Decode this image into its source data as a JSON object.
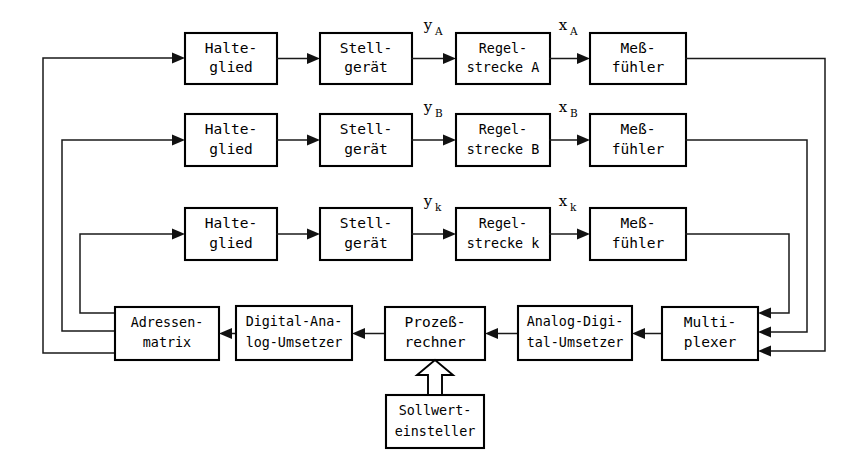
{
  "diagram": {
    "stroke_color": "#1a1a1a",
    "box_stroke_color": "#000000",
    "background_color": "#ffffff"
  },
  "rows": [
    {
      "id": "row-a",
      "halteglied": {
        "line1": "Halte-",
        "line2": "glied"
      },
      "stellgeraet": {
        "line1": "Stell-",
        "line2": "gerät"
      },
      "regelstrecke": {
        "line1": "Regel-",
        "line2": "strecke A"
      },
      "messfuehler": {
        "line1": "Meß-",
        "line2": "fühler"
      },
      "signal_y": {
        "base": "y",
        "sub": "A"
      },
      "signal_x": {
        "base": "x",
        "sub": "A"
      }
    },
    {
      "id": "row-b",
      "halteglied": {
        "line1": "Halte-",
        "line2": "glied"
      },
      "stellgeraet": {
        "line1": "Stell-",
        "line2": "gerät"
      },
      "regelstrecke": {
        "line1": "Regel-",
        "line2": "strecke B"
      },
      "messfuehler": {
        "line1": "Meß-",
        "line2": "fühler"
      },
      "signal_y": {
        "base": "y",
        "sub": "B"
      },
      "signal_x": {
        "base": "x",
        "sub": "B"
      }
    },
    {
      "id": "row-k",
      "halteglied": {
        "line1": "Halte-",
        "line2": "glied"
      },
      "stellgeraet": {
        "line1": "Stell-",
        "line2": "gerät"
      },
      "regelstrecke": {
        "line1": "Regel-",
        "line2": "strecke k"
      },
      "messfuehler": {
        "line1": "Meß-",
        "line2": "fühler"
      },
      "signal_y": {
        "base": "y",
        "sub": "k"
      },
      "signal_x": {
        "base": "x",
        "sub": "k"
      }
    }
  ],
  "bottom": {
    "adressenmatrix": {
      "line1": "Adressen-",
      "line2": "matrix"
    },
    "da_umsetzer": {
      "line1": "Digital-Ana-",
      "line2": "log-Umsetzer"
    },
    "prozessrechner": {
      "line1": "Prozeß-",
      "line2": "rechner"
    },
    "ad_umsetzer": {
      "line1": "Analog-Digi-",
      "line2": "tal-Umsetzer"
    },
    "multiplexer": {
      "line1": "Multi-",
      "line2": "plexer"
    },
    "sollwerteinsteller": {
      "line1": "Sollwert-",
      "line2": "einsteller"
    }
  }
}
